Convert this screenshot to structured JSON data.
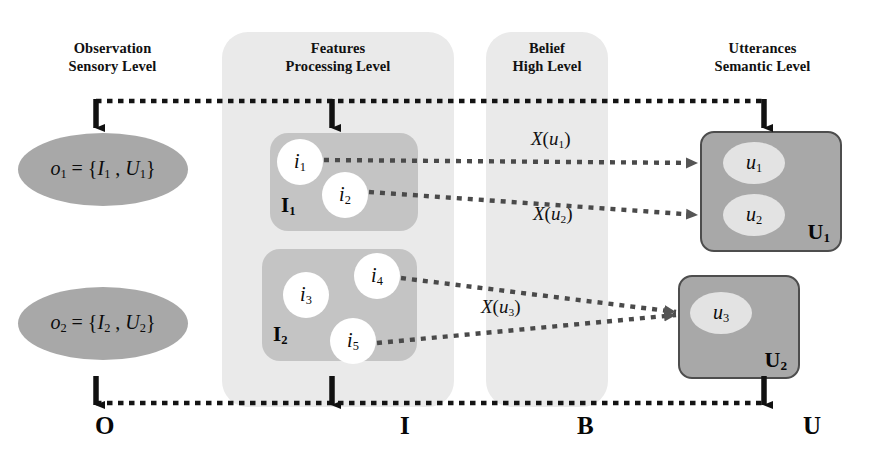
{
  "diagram": {
    "columns": [
      {
        "name": "observation",
        "line1": "Observation",
        "line2": "Sensory Level",
        "bottom_label": "O"
      },
      {
        "name": "features",
        "line1": "Features",
        "line2": "Processing Level",
        "bottom_label": "I"
      },
      {
        "name": "belief",
        "line1": "Belief",
        "line2": "High Level",
        "bottom_label": "B"
      },
      {
        "name": "utterances",
        "line1": "Utterances",
        "line2": "Semantic Level",
        "bottom_label": "U"
      }
    ],
    "observations": [
      {
        "name": "observation-1",
        "text": "o₁ = {I₁ , U₁}",
        "var": "o",
        "sub": "1"
      },
      {
        "name": "observation-2",
        "text": "o₂ = {I₂ , U₂}",
        "var": "o",
        "sub": "2"
      }
    ],
    "feature_groups": [
      {
        "name": "feature-group-I1",
        "label": "I",
        "label_sub": "1",
        "items": [
          {
            "name": "feature-i1",
            "var": "i",
            "sub": "1"
          },
          {
            "name": "feature-i2",
            "var": "i",
            "sub": "2"
          }
        ]
      },
      {
        "name": "feature-group-I2",
        "label": "I",
        "label_sub": "2",
        "items": [
          {
            "name": "feature-i3",
            "var": "i",
            "sub": "3"
          },
          {
            "name": "feature-i4",
            "var": "i",
            "sub": "4"
          },
          {
            "name": "feature-i5",
            "var": "i",
            "sub": "5"
          }
        ]
      }
    ],
    "utterance_groups": [
      {
        "name": "utterance-group-U1",
        "label": "U",
        "label_sub": "1",
        "items": [
          {
            "name": "utterance-u1",
            "var": "u",
            "sub": "1"
          },
          {
            "name": "utterance-u2",
            "var": "u",
            "sub": "2"
          }
        ]
      },
      {
        "name": "utterance-group-U2",
        "label": "U",
        "label_sub": "2",
        "items": [
          {
            "name": "utterance-u3",
            "var": "u",
            "sub": "3"
          }
        ]
      }
    ],
    "mappings": [
      {
        "name": "mapping-x-u1",
        "fn": "X",
        "var": "u",
        "sub": "1"
      },
      {
        "name": "mapping-x-u2",
        "fn": "X",
        "var": "u",
        "sub": "2"
      },
      {
        "name": "mapping-x-u3",
        "fn": "X",
        "var": "u",
        "sub": "3"
      }
    ],
    "colors": {
      "panel": "#eaeaea",
      "observation_fill": "#a8a8a8",
      "feature_group_fill": "#c4c4c4",
      "feature_circle_fill": "#ffffff",
      "utterance_box_fill": "#a8a8a8",
      "utterance_box_stroke": "#4d4d4d",
      "utterance_ellipse_fill": "#e3e3e3",
      "line": "#1a1a1a",
      "text": "#0b0b0b"
    }
  }
}
